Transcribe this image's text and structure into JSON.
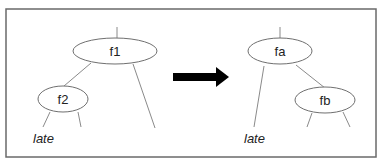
{
  "diagram": {
    "type": "tree-rotation",
    "before": {
      "nodes": [
        {
          "id": "f1",
          "label": "f1"
        },
        {
          "id": "f2",
          "label": "f2"
        }
      ],
      "leaf_label": "late"
    },
    "after": {
      "nodes": [
        {
          "id": "fa",
          "label": "fa"
        },
        {
          "id": "fb",
          "label": "fb"
        }
      ],
      "leaf_label": "late"
    },
    "transition": "arrow-right",
    "colors": {
      "frame": "#6a6a6a",
      "edge": "#8a8a8a",
      "arrow": "#000000"
    }
  }
}
